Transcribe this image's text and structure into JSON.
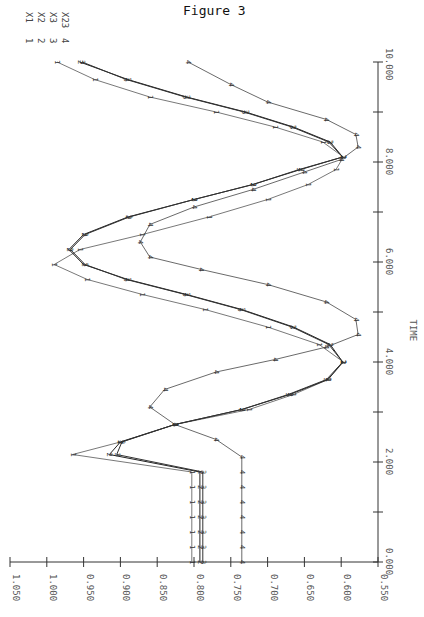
{
  "title": "Figure 3",
  "chart_data": {
    "type": "line",
    "title": "Figure 3",
    "orientation": "rotated-90 (time axis vertical on right, value axis horizontal at bottom, reversed)",
    "xlabel": "TIME",
    "ylabel": "",
    "xlim": [
      0.0,
      10.0
    ],
    "ylim": [
      0.55,
      1.05
    ],
    "x_ticks": [
      "0.000",
      "2.000",
      "4.000",
      "6.000",
      "8.000",
      "10.000"
    ],
    "x_minor_ticks": [
      1,
      3,
      5,
      7,
      9
    ],
    "y_ticks": [
      "1.050",
      "1.000",
      "0.950",
      "0.900",
      "0.850",
      "0.800",
      "0.750",
      "0.700",
      "0.650",
      "0.600",
      "0.550"
    ],
    "grid": false,
    "legend": [
      {
        "marker": "1",
        "label": "X1"
      },
      {
        "marker": "2",
        "label": "X2"
      },
      {
        "marker": "3",
        "label": "X3"
      },
      {
        "marker": "4",
        "label": "X23"
      }
    ],
    "legend_position": "top-left (rotated)",
    "series": [
      {
        "name": "X1",
        "marker": "1",
        "x": [
          0.0,
          0.3,
          0.6,
          0.9,
          1.2,
          1.5,
          1.8,
          2.15,
          2.4,
          2.75,
          3.05,
          3.35,
          3.65,
          4.0,
          4.35,
          4.7,
          5.05,
          5.35,
          5.65,
          5.95,
          6.25,
          6.55,
          6.9,
          7.25,
          7.55,
          7.85,
          8.1,
          8.4,
          8.7,
          9.0,
          9.3,
          9.65,
          10.0
        ],
        "values": [
          0.803,
          0.803,
          0.803,
          0.803,
          0.803,
          0.803,
          0.803,
          0.965,
          0.9,
          0.826,
          0.725,
          0.665,
          0.618,
          0.597,
          0.63,
          0.7,
          0.785,
          0.87,
          0.945,
          0.99,
          0.955,
          0.87,
          0.78,
          0.7,
          0.645,
          0.607,
          0.597,
          0.625,
          0.69,
          0.77,
          0.86,
          0.935,
          0.986
        ]
      },
      {
        "name": "X2",
        "marker": "2",
        "x": [
          0.0,
          0.3,
          0.6,
          0.9,
          1.2,
          1.5,
          1.8,
          2.15,
          2.4,
          2.75,
          3.05,
          3.35,
          3.65,
          4.0,
          4.35,
          4.7,
          5.05,
          5.35,
          5.65,
          5.95,
          6.25,
          6.55,
          6.9,
          7.25,
          7.55,
          7.85,
          8.1,
          8.4,
          8.7,
          9.0,
          9.3,
          9.65,
          10.0
        ],
        "values": [
          0.792,
          0.792,
          0.792,
          0.792,
          0.792,
          0.792,
          0.792,
          0.915,
          0.9,
          0.826,
          0.735,
          0.67,
          0.618,
          0.598,
          0.615,
          0.665,
          0.735,
          0.81,
          0.89,
          0.95,
          0.97,
          0.95,
          0.89,
          0.8,
          0.72,
          0.655,
          0.598,
          0.615,
          0.665,
          0.73,
          0.81,
          0.89,
          0.955
        ]
      },
      {
        "name": "X3",
        "marker": "3",
        "x": [
          0.0,
          0.3,
          0.6,
          0.9,
          1.2,
          1.5,
          1.8,
          2.15,
          2.4,
          2.75,
          3.05,
          3.35,
          3.65,
          4.0,
          4.35,
          4.7,
          5.05,
          5.35,
          5.65,
          5.95,
          6.25,
          6.55,
          6.9,
          7.25,
          7.55,
          7.85,
          8.1,
          8.4,
          8.7,
          9.0,
          9.3,
          9.65,
          10.0
        ],
        "values": [
          0.788,
          0.788,
          0.788,
          0.788,
          0.788,
          0.788,
          0.788,
          0.905,
          0.898,
          0.826,
          0.735,
          0.672,
          0.62,
          0.598,
          0.617,
          0.667,
          0.737,
          0.812,
          0.892,
          0.948,
          0.968,
          0.948,
          0.888,
          0.8,
          0.72,
          0.657,
          0.598,
          0.617,
          0.667,
          0.732,
          0.812,
          0.892,
          0.952
        ]
      },
      {
        "name": "X23",
        "marker": "4",
        "x": [
          0.0,
          0.3,
          0.6,
          0.9,
          1.2,
          1.5,
          1.8,
          2.1,
          2.45,
          2.75,
          3.1,
          3.45,
          3.8,
          4.05,
          4.3,
          4.55,
          4.85,
          5.2,
          5.55,
          5.85,
          6.1,
          6.4,
          6.75,
          7.1,
          7.45,
          7.8,
          8.05,
          8.3,
          8.55,
          8.85,
          9.2,
          9.55,
          10.0
        ],
        "values": [
          0.735,
          0.735,
          0.735,
          0.735,
          0.735,
          0.735,
          0.735,
          0.735,
          0.77,
          0.826,
          0.86,
          0.84,
          0.77,
          0.69,
          0.62,
          0.577,
          0.58,
          0.62,
          0.7,
          0.79,
          0.86,
          0.873,
          0.86,
          0.8,
          0.72,
          0.65,
          0.6,
          0.577,
          0.58,
          0.62,
          0.7,
          0.75,
          0.808
        ]
      }
    ]
  },
  "axes": {
    "time_label": "TIME",
    "time_ticks": [
      {
        "label": "0.000",
        "t": 0
      },
      {
        "label": "2.000",
        "t": 2
      },
      {
        "label": "4.000",
        "t": 4
      },
      {
        "label": "6.000",
        "t": 6
      },
      {
        "label": "8.000",
        "t": 8
      },
      {
        "label": "10.000",
        "t": 10
      }
    ],
    "value_ticks": [
      "1.050",
      "1.000",
      "0.950",
      "0.900",
      "0.850",
      "0.800",
      "0.750",
      "0.700",
      "0.650",
      "0.600",
      "0.550"
    ]
  },
  "legend": [
    {
      "num": "1",
      "label": "X1"
    },
    {
      "num": "2",
      "label": "X2"
    },
    {
      "num": "3",
      "label": "X3"
    },
    {
      "num": "4",
      "label": "X23"
    }
  ]
}
